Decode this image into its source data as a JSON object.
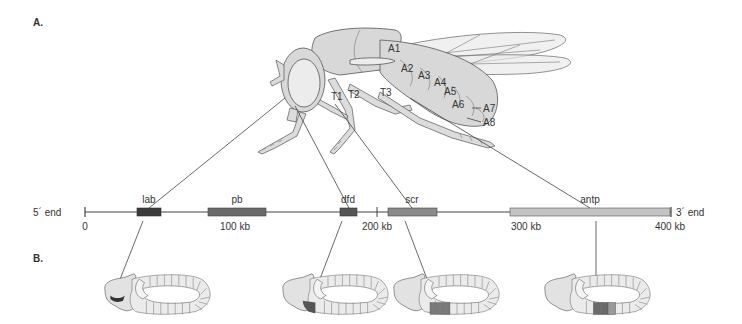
{
  "panels": {
    "a_label": "A.",
    "b_label": "B."
  },
  "fly": {
    "segments": [
      "T1",
      "T2",
      "T3",
      "A1",
      "A2",
      "A3",
      "A4",
      "A5",
      "A6",
      "A7",
      "A8"
    ]
  },
  "gene_map": {
    "left_end_label": "5´ end",
    "right_end_label": "3´ end",
    "scale_labels": [
      "0",
      "100 kb",
      "200 kb",
      "300 kb",
      "400 kb"
    ],
    "genes": [
      {
        "name": "lab",
        "color": "#3a3a3a"
      },
      {
        "name": "pb",
        "color": "#6a6a6a"
      },
      {
        "name": "dfd",
        "color": "#555555"
      },
      {
        "name": "scr",
        "color": "#8a8a8a"
      },
      {
        "name": "antp",
        "color": "#c4c4c4"
      }
    ]
  },
  "embryos": [
    {
      "gene": "lab",
      "expression_color": "#333333"
    },
    {
      "gene": "dfd",
      "expression_color": "#555555"
    },
    {
      "gene": "scr",
      "expression_color": "#7a7a7a"
    },
    {
      "gene": "antp",
      "expression_color": "#6a6a6a"
    }
  ]
}
